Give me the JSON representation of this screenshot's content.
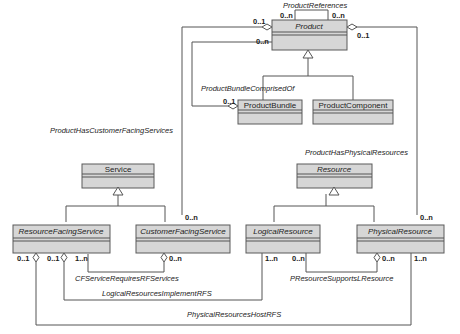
{
  "diagram": {
    "type": "UML class diagram",
    "classes": {
      "product": {
        "name": "Product",
        "abstract": true
      },
      "product_bundle": {
        "name": "ProductBundle",
        "abstract": false
      },
      "product_component": {
        "name": "ProductComponent",
        "abstract": false
      },
      "service": {
        "name": "Service",
        "abstract": false
      },
      "resource_facing_service": {
        "name": "ResourceFacingService",
        "abstract": true
      },
      "customer_facing_service": {
        "name": "CustomerFacingService",
        "abstract": true
      },
      "resource": {
        "name": "Resource",
        "abstract": true
      },
      "logical_resource": {
        "name": "LogicalResource",
        "abstract": true
      },
      "physical_resource": {
        "name": "PhysicalResource",
        "abstract": true
      }
    },
    "associations": {
      "product_references": {
        "label": "ProductReferences",
        "mult_a": "0..n",
        "mult_b": "0..n"
      },
      "product_bundle_comprised_of": {
        "label": "ProductBundleComprisedOf",
        "mult_product": "0..n",
        "mult_bundle": "0..1"
      },
      "product_has_cfs": {
        "label": "ProductHasCustomerFacingServices",
        "mult_product": "0..1",
        "mult_cfs": "0..n"
      },
      "product_has_physical_resources": {
        "label": "ProductHasPhysicalResources",
        "mult_product": "0..1",
        "mult_pr": "0..n"
      },
      "cfs_requires_rfs": {
        "label": "CFServiceRequiresRFServices",
        "mult_rfs": "1..n",
        "mult_cfs": "0..n"
      },
      "logical_resources_implement_rfs": {
        "label": "LogicalResourcesImplementRFS",
        "mult_rfs": "0..1",
        "mult_lr": "1..n"
      },
      "presource_supports_lresource": {
        "label": "PResourceSupportsLResource",
        "mult_lr": "0..n",
        "mult_pr": "0..n"
      },
      "physical_resources_host_rfs": {
        "label": "PhysicalResourcesHostRFS",
        "mult_rfs": "0..1",
        "mult_pr": "1..n"
      }
    }
  }
}
